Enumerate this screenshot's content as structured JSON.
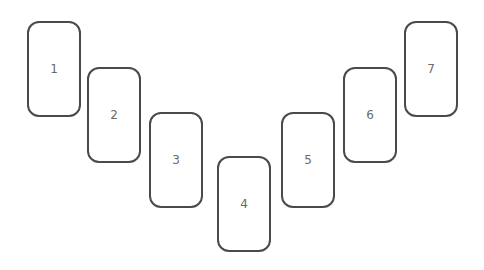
{
  "diagram": {
    "type": "card-spread",
    "layout": "V-shape",
    "stroke_color": "#4a4a4a",
    "label_color": "#6a6a6a",
    "cards": [
      {
        "label": "1",
        "x": 27,
        "y": 21
      },
      {
        "label": "2",
        "x": 87,
        "y": 67
      },
      {
        "label": "3",
        "x": 149,
        "y": 112
      },
      {
        "label": "4",
        "x": 217,
        "y": 156
      },
      {
        "label": "5",
        "x": 281,
        "y": 112
      },
      {
        "label": "6",
        "x": 343,
        "y": 67
      },
      {
        "label": "7",
        "x": 404,
        "y": 21
      }
    ]
  }
}
